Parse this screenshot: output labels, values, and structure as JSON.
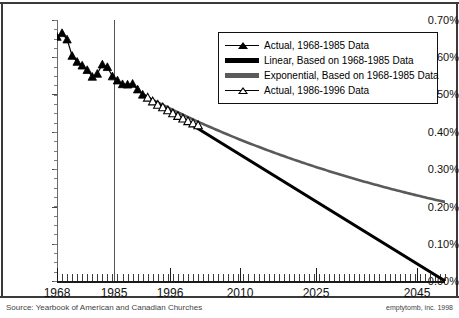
{
  "chart_data": {
    "type": "line",
    "title": "",
    "xlabel": "",
    "ylabel": "",
    "xlim": [
      1968,
      2045
    ],
    "ylim": [
      0.0,
      0.7
    ],
    "y_tick_labels": [
      "0.70%",
      "0.60%",
      "0.50%",
      "0.40%",
      "0.30%",
      "0.20%",
      "0.10%",
      "0.00%"
    ],
    "y_tick_values": [
      0.7,
      0.6,
      0.5,
      0.4,
      0.3,
      0.2,
      0.1,
      0.0
    ],
    "x_tick_labels": [
      "1968",
      "1985",
      "1996",
      "2010",
      "2025",
      "2045"
    ],
    "x_tick_values": [
      1968,
      1985,
      1996,
      2010,
      2025,
      2045
    ],
    "grid": false,
    "legend_position": "top-right",
    "annotations": [
      {
        "name": "divider-1985",
        "type": "vertical-line",
        "x": 1985
      }
    ],
    "series": [
      {
        "name": "Actual, 1968-1985 Data",
        "marker": "filled-triangle",
        "color": "#000000",
        "x": [
          1968,
          1969,
          1970,
          1971,
          1972,
          1973,
          1974,
          1975,
          1976,
          1977,
          1978,
          1979,
          1980,
          1981,
          1982,
          1983,
          1984,
          1985
        ],
        "values": [
          0.655,
          0.665,
          0.648,
          0.604,
          0.588,
          0.578,
          0.566,
          0.548,
          0.556,
          0.581,
          0.574,
          0.549,
          0.538,
          0.528,
          0.527,
          0.529,
          0.514,
          0.5
        ]
      },
      {
        "name": "Actual, 1986-1996 Data",
        "marker": "open-triangle",
        "color": "#000000",
        "x": [
          1986,
          1987,
          1988,
          1989,
          1990,
          1991,
          1992,
          1993,
          1994,
          1995,
          1996
        ],
        "values": [
          0.492,
          0.482,
          0.473,
          0.466,
          0.458,
          0.45,
          0.443,
          0.436,
          0.429,
          0.423,
          0.418
        ]
      },
      {
        "name": "Linear, Based on 1968-1985 Data",
        "marker": "none",
        "style": "thick-solid",
        "color": "#000000",
        "x": [
          1985,
          2045
        ],
        "values": [
          0.5,
          0.0
        ]
      },
      {
        "name": "Exponential, Based on 1968-1985 Data",
        "marker": "none",
        "style": "thick-solid",
        "color": "#5a5a5a",
        "x": [
          1985,
          1996,
          2010,
          2025,
          2045
        ],
        "values": [
          0.5,
          0.432,
          0.363,
          0.295,
          0.212
        ]
      }
    ]
  },
  "legend": {
    "items": [
      {
        "label": "Actual, 1968-1985 Data",
        "swatch": "filled-triangle-line"
      },
      {
        "label": "Linear, Based on 1968-1985 Data",
        "swatch": "thick-black-line"
      },
      {
        "label": "Exponential, Based on 1968-1985 Data",
        "swatch": "thick-gray-line"
      },
      {
        "label": "Actual, 1986-1996 Data",
        "swatch": "open-triangle-line"
      }
    ]
  },
  "captions": {
    "source": "Source: Yearbook of American and Canadian Churches",
    "credit": "emptytomb, inc. 1998"
  }
}
